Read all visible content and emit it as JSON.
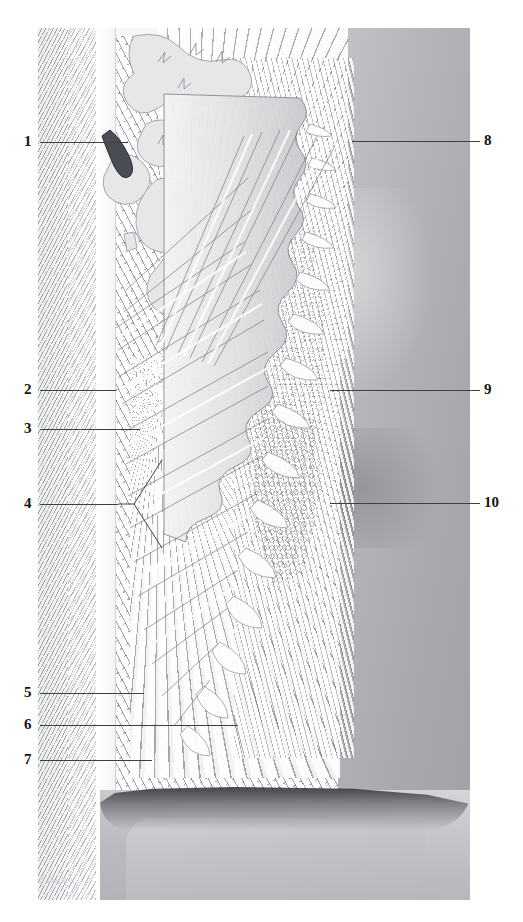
{
  "figure": {
    "top_caption": "",
    "signature": "© Duckett",
    "type": "grayscale anatomical histology illustration",
    "plate": {
      "x": 38,
      "y": 28,
      "width": 432,
      "height": 872,
      "background_color": "#f7f7f7"
    },
    "palette": {
      "paper": "#ffffff",
      "line": "#3d3f43",
      "number": "#111315",
      "bone_hatch": "#787c84",
      "gingiva_light": "#e2e3e4",
      "gingiva_mid": "#c3c4c7",
      "gingiva_deep": "#a7a8ac",
      "crown": "#bdbec1",
      "sulcus_shadow": "#282a2e",
      "caption": "#dcdee2"
    }
  },
  "labels_left": [
    {
      "number": "1",
      "num_x": 24,
      "num_y": 134,
      "line_x": 40,
      "line_y": 142,
      "line_w": 88,
      "fork": null
    },
    {
      "number": "2",
      "num_x": 24,
      "num_y": 382,
      "line_x": 40,
      "line_y": 390,
      "line_w": 76,
      "fork": null
    },
    {
      "number": "3",
      "num_x": 24,
      "num_y": 421,
      "line_x": 40,
      "line_y": 429,
      "line_w": 100,
      "fork": null
    },
    {
      "number": "4",
      "num_x": 24,
      "num_y": 496,
      "line_x": 40,
      "line_y": 504,
      "line_w": 78,
      "fork": "true"
    },
    {
      "number": "5",
      "num_x": 24,
      "num_y": 685,
      "line_x": 40,
      "line_y": 693,
      "line_w": 104,
      "fork": null
    },
    {
      "number": "6",
      "num_x": 24,
      "num_y": 717,
      "line_x": 40,
      "line_y": 725,
      "line_w": 198,
      "fork": null
    },
    {
      "number": "7",
      "num_x": 24,
      "num_y": 752,
      "line_x": 40,
      "line_y": 760,
      "line_w": 112,
      "fork": null
    }
  ],
  "labels_right": [
    {
      "number": "8",
      "num_x": 484,
      "num_y": 133,
      "line_x": 352,
      "line_y": 141,
      "line_w": 128
    },
    {
      "number": "9",
      "num_x": 484,
      "num_y": 382,
      "line_x": 330,
      "line_y": 390,
      "line_w": 150
    },
    {
      "number": "10",
      "num_x": 484,
      "num_y": 495,
      "line_x": 330,
      "line_y": 503,
      "line_w": 150
    }
  ]
}
